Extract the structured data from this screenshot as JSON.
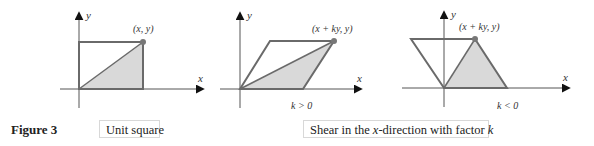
{
  "figure_label": "Figure 3",
  "captions": {
    "unit_square": "Unit square",
    "shear": {
      "prefix": "Shear in the ",
      "var": "x",
      "middle": "-direction with factor ",
      "factor": "k"
    }
  },
  "panels": [
    {
      "name": "unit-square",
      "point_label": "(x, y)",
      "axis_x": "x",
      "axis_y": "y",
      "condition": ""
    },
    {
      "name": "shear-k-positive",
      "point_label": "(x + ky, y)",
      "axis_x": "x",
      "axis_y": "y",
      "condition": "k > 0"
    },
    {
      "name": "shear-k-negative",
      "point_label": "(x + ky, y)",
      "axis_x": "x",
      "axis_y": "y",
      "condition": "k < 0"
    }
  ],
  "colors": {
    "stroke": "#6a6a6a",
    "fill": "#d9d9d9",
    "axis": "#555555",
    "point": "#777777"
  }
}
